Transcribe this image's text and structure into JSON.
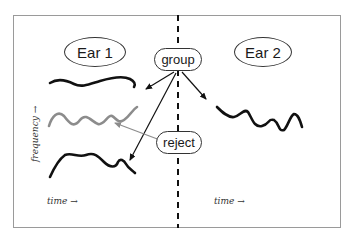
{
  "ear_left": {
    "label": "Ear 1"
  },
  "ear_right": {
    "label": "Ear 2"
  },
  "group_label": "group",
  "reject_label": "reject",
  "axes": {
    "y_label": "frequency →",
    "x_label_left": "time →",
    "x_label_right": "time →"
  },
  "colors": {
    "stroke": "#111111",
    "rejected_stroke": "#8c8c8c",
    "frame": "#9a9a9a",
    "divider": "#111111"
  }
}
